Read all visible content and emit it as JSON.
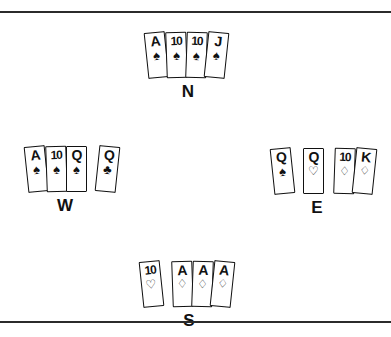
{
  "diagram": {
    "type": "bridge-hand-diagram",
    "background_color": "#ffffff",
    "ink_color": "#111111",
    "rule_color": "#2b2b2b",
    "suit_glyphs": {
      "spade": "♠",
      "heart": "♡",
      "diamond": "♢",
      "club": "♣"
    }
  },
  "hands": {
    "north": {
      "label": "N",
      "groups": [
        {
          "cards": [
            {
              "rank": "A",
              "suit": "spade",
              "glyph": "♠"
            },
            {
              "rank": "10",
              "suit": "spade",
              "glyph": "♠"
            },
            {
              "rank": "10",
              "suit": "spade",
              "glyph": "♠"
            },
            {
              "rank": "J",
              "suit": "spade",
              "glyph": "♠"
            }
          ]
        }
      ]
    },
    "west": {
      "label": "W",
      "groups": [
        {
          "cards": [
            {
              "rank": "A",
              "suit": "spade",
              "glyph": "♠"
            },
            {
              "rank": "10",
              "suit": "spade",
              "glyph": "♠"
            },
            {
              "rank": "Q",
              "suit": "spade",
              "glyph": "♠"
            }
          ]
        },
        {
          "cards": [
            {
              "rank": "Q",
              "suit": "club",
              "glyph": "♣"
            }
          ]
        }
      ]
    },
    "east": {
      "label": "E",
      "groups": [
        {
          "cards": [
            {
              "rank": "Q",
              "suit": "spade",
              "glyph": "♠"
            }
          ]
        },
        {
          "cards": [
            {
              "rank": "Q",
              "suit": "heart",
              "glyph": "♡"
            }
          ]
        },
        {
          "cards": [
            {
              "rank": "10",
              "suit": "diamond",
              "glyph": "♢"
            },
            {
              "rank": "K",
              "suit": "diamond",
              "glyph": "♢"
            }
          ]
        }
      ]
    },
    "south": {
      "label": "S",
      "groups": [
        {
          "cards": [
            {
              "rank": "10",
              "suit": "heart",
              "glyph": "♡"
            }
          ]
        },
        {
          "cards": [
            {
              "rank": "A",
              "suit": "diamond",
              "glyph": "♢"
            },
            {
              "rank": "A",
              "suit": "diamond",
              "glyph": "♢"
            },
            {
              "rank": "A",
              "suit": "diamond",
              "glyph": "♢"
            }
          ]
        }
      ]
    }
  }
}
